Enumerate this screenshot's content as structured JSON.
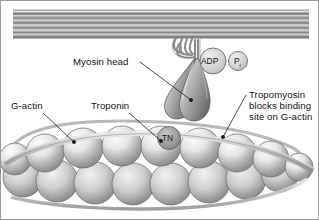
{
  "figure": {
    "background_color": "#ffffff",
    "border_color": "#9a9a9a",
    "text_color": "#111111"
  },
  "labels": {
    "myosin_head": "Myosin head",
    "g_actin": "G-actin",
    "troponin": "Troponin",
    "tropomyosin_line1": "Tropomyosin",
    "tropomyosin_line2": "blocks binding",
    "tropomyosin_line3": "site on G-actin"
  },
  "nodes": {
    "adp": "ADP",
    "pi_main": "P",
    "pi_sub": "i",
    "tn": "TN"
  },
  "structures": {
    "thick_filament": {
      "name": "Myosin thick filament",
      "stripe_count": 9,
      "color_light": "#d8d8d8",
      "color_dark": "#6e6e6e"
    },
    "myosin_neck": {
      "name": "Coiled myosin neck / hinge",
      "coil_turns": 4,
      "color": "#8d8d8d"
    },
    "myosin_head": {
      "name": "Myosin head lobes",
      "lobe_count": 2,
      "color_light": "#cfcfcf",
      "color_dark": "#7f7f7f"
    },
    "actin_filament": {
      "name": "F-actin double helix of G-actin monomers",
      "top_row_count": 8,
      "bottom_row_count": 8,
      "monomer_color_light": "#efefef",
      "monomer_color_dark": "#8e8e8e"
    },
    "tropomyosin": {
      "name": "Tropomyosin strand",
      "color": "#bdbdbd",
      "strand_count": 2
    },
    "troponin_complex": {
      "name": "Troponin complex",
      "color": "#8a8a8a"
    }
  }
}
